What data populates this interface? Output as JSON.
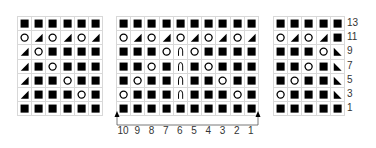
{
  "legend_symbols": {
    "K": "filled-square (knit)",
    "O": "open-circle (yarn over)",
    "R": "right-triangle-bottom-right (k2tog)",
    "L": "right-triangle-bottom-left (ssk)",
    "A": "arch (centered double decrease)"
  },
  "charts": [
    {
      "id": "left",
      "columns": 6,
      "rows": [
        "KKKKKK",
        "OROROR",
        "ROKKKK",
        "RKOKKK",
        "RKKOKK",
        "RKKKOK",
        "KKKKKK"
      ]
    },
    {
      "id": "middle",
      "columns": 10,
      "rows": [
        "KKKKKKKKKK",
        "OROROROROR",
        "KKKOAOKKKK",
        "KKOKAKOKKK",
        "KOKKAKKOKK",
        "OKKKAKKKOK",
        "KKKKKKKKKK"
      ],
      "column_numbers": [
        "10",
        "9",
        "8",
        "7",
        "6",
        "5",
        "4",
        "3",
        "2",
        "1"
      ],
      "repeat_bracket": true
    },
    {
      "id": "right",
      "columns": 5,
      "rows": [
        "KKKKK",
        "ORORK",
        "KKKOL",
        "KKOKL",
        "KOKKL",
        "OKKKL",
        "KKKKK"
      ]
    }
  ],
  "row_numbers": [
    "13",
    "11",
    "9",
    "7",
    "5",
    "3",
    "1"
  ],
  "colors": {
    "symbol": "#000000",
    "gridline": "#d8d8d8",
    "text": "#333333"
  }
}
